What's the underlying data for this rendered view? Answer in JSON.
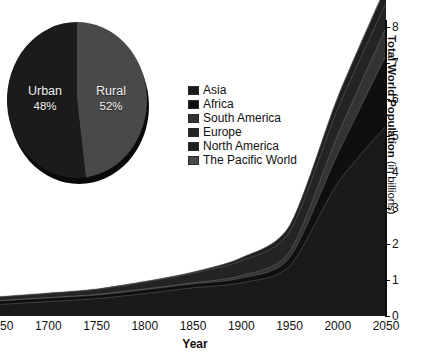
{
  "chart_data": [
    {
      "type": "area",
      "title": "",
      "xlabel": "Year",
      "ylabel": "Total World Population (in billions)",
      "ylabel_bold_part": "Total World Population",
      "ylabel_regular_part": "(in billions)",
      "xticks": [
        "1650",
        "1700",
        "1750",
        "1800",
        "1850",
        "1900",
        "1950",
        "2000",
        "2050"
      ],
      "x": [
        1650,
        1700,
        1750,
        1800,
        1850,
        1900,
        1950,
        2000,
        2050
      ],
      "yticks": [
        "0",
        "1",
        "2",
        "3",
        "4",
        "5",
        "6",
        "7",
        "8"
      ],
      "ylim": [
        0,
        8.2
      ],
      "xlim": [
        1650,
        2050
      ],
      "grid": false,
      "stacked": true,
      "legend_position": "center-left",
      "series": [
        {
          "name": "Asia",
          "color": "#1a1a1a",
          "values": [
            0.32,
            0.4,
            0.48,
            0.62,
            0.78,
            0.92,
            1.38,
            3.68,
            5.27
          ]
        },
        {
          "name": "Africa",
          "color": "#0f0f0f",
          "values": [
            0.1,
            0.1,
            0.1,
            0.11,
            0.11,
            0.13,
            0.23,
            0.81,
            1.94
          ]
        },
        {
          "name": "South America",
          "color": "#333333",
          "values": [
            0.01,
            0.01,
            0.02,
            0.02,
            0.03,
            0.07,
            0.17,
            0.52,
            0.78
          ]
        },
        {
          "name": "Europe",
          "color": "#242424",
          "values": [
            0.1,
            0.12,
            0.14,
            0.19,
            0.27,
            0.41,
            0.55,
            0.73,
            0.68
          ]
        },
        {
          "name": "North America",
          "color": "#1f1f1f",
          "values": [
            0.01,
            0.01,
            0.01,
            0.02,
            0.03,
            0.08,
            0.17,
            0.31,
            0.44
          ]
        },
        {
          "name": "The Pacific World",
          "color": "#4a4a4a",
          "values": [
            0.0,
            0.0,
            0.0,
            0.0,
            0.0,
            0.01,
            0.01,
            0.03,
            0.05
          ]
        }
      ]
    },
    {
      "type": "pie",
      "title": "",
      "labels": [
        "Urban",
        "Rural"
      ],
      "values": [
        48,
        52
      ],
      "value_labels": [
        "48%",
        "52%"
      ],
      "colors": [
        "#494949",
        "#1b1b1b"
      ],
      "start_angle_deg": 0
    }
  ],
  "legend": {
    "items": [
      {
        "label": "Asia",
        "swatch": "#1a1a1a"
      },
      {
        "label": "Africa",
        "swatch": "#0f0f0f"
      },
      {
        "label": "South America",
        "swatch": "#333333"
      },
      {
        "label": "Europe",
        "swatch": "#242424"
      },
      {
        "label": "North America",
        "swatch": "#1f1f1f"
      },
      {
        "label": "The Pacific World",
        "swatch": "#4a4a4a"
      }
    ]
  },
  "pie": {
    "slices": [
      {
        "name": "Urban",
        "pct": "48%"
      },
      {
        "name": "Rural",
        "pct": "52%"
      }
    ]
  },
  "axes": {
    "x_title": "Year",
    "y_title_bold": "Total World Population",
    "y_title_regular": "(in billions)"
  }
}
